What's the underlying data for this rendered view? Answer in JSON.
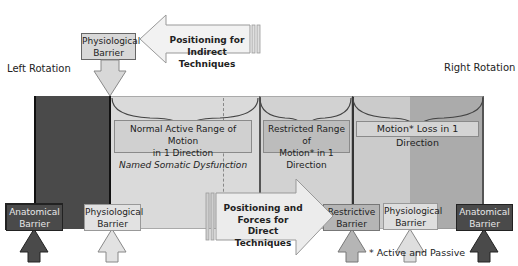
{
  "labels": {
    "left_rotation": "Left Rotation",
    "right_rotation": "Right Rotation",
    "footnote": "* Active and Passive"
  },
  "top": {
    "physiological_barrier": "Physiological Barrier",
    "indirect_arrow_line1": "Positioning for",
    "indirect_arrow_line2": "Indirect Techniques"
  },
  "band": {
    "normal_line1": "Normal Active Range of Motion",
    "normal_line2": "in 1 Direction",
    "normal_line3": "Named Somatic Dysfunction",
    "restricted_line1": "Restricted Range of",
    "restricted_line2": "Motion* in 1",
    "restricted_line3": "Direction",
    "loss": "Motion* Loss in 1 Direction"
  },
  "bottom": {
    "anatomical_left_1": "Anatomical",
    "anatomical_left_2": "Barrier",
    "physiological_left_1": "Physiological",
    "physiological_left_2": "Barrier",
    "direct_arrow_line1": "Positioning and",
    "direct_arrow_line2": "Forces for",
    "direct_arrow_line3": "Direct Techniques",
    "restrictive_1": "Restrictive",
    "restrictive_2": "Barrier",
    "physiological_right_1": "Physiological",
    "physiological_right_2": "Barrier",
    "anatomical_right_1": "Anatomical",
    "anatomical_right_2": "Barrier"
  },
  "colors": {
    "anatomical": "#4a4a4a",
    "normal_band": "#d9d9d9",
    "restricted_band": "#cfcfcf",
    "loss_light": "#c8c8c8",
    "loss_dark": "#a9a9a9",
    "restrictive_box": "#b5b5b5",
    "physiological_box": "#dcdcdc"
  }
}
